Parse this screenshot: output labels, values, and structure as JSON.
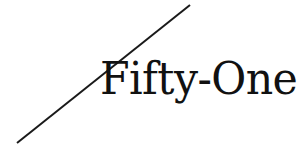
{
  "canvas": {
    "width_px": 297,
    "height_px": 145,
    "background_color": "#ffffff"
  },
  "logo": {
    "wordmark_text": "Fifty-One",
    "wordmark_color": "#111111",
    "typeface_style": "high-contrast didone serif",
    "alt_text": "Fifty-One"
  },
  "diagonal_rule": {
    "name": "diagonal-slash",
    "color": "#1a1a1a",
    "stroke_width_px": 2,
    "start_x": 17,
    "start_y": 143,
    "end_x": 190,
    "end_y": 5
  }
}
